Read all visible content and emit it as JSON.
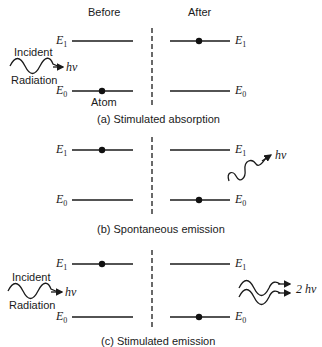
{
  "headers": {
    "before": "Before",
    "after": "After"
  },
  "levels": {
    "upper": "E",
    "upper_sub": "1",
    "lower": "E",
    "lower_sub": "0"
  },
  "labels": {
    "incident_1": "Incident",
    "incident_2": "Radiation",
    "photon": "hν",
    "two_photons": "2 hν",
    "atom": "Atom"
  },
  "panels": [
    {
      "id": "a",
      "caption": "(a)  Stimulated absorption",
      "before_electron": "E0",
      "after_electron": "E1",
      "incident": true,
      "emitted": "none"
    },
    {
      "id": "b",
      "caption": "(b)  Spontaneous emission",
      "before_electron": "E1",
      "after_electron": "E0",
      "incident": false,
      "emitted": "single-wavy-photon"
    },
    {
      "id": "c",
      "caption": "(c)  Stimulated emission",
      "before_electron": "E1",
      "after_electron": "E0",
      "incident": true,
      "emitted": "two-coherent-photons"
    }
  ]
}
